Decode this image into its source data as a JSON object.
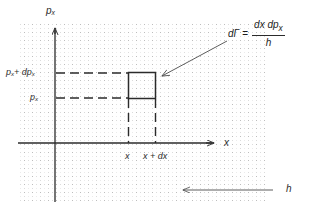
{
  "figure": {
    "type": "physics-diagram",
    "background": "#ffffff",
    "ink_color": "#2b2b2b",
    "grid_color": "#c9c9c9",
    "grid_spacing_px": 8,
    "plot_area": {
      "x": 18,
      "y": 22,
      "width": 248,
      "height": 180
    }
  },
  "axes": {
    "vertical": {
      "name": "momentum-axis",
      "label_main": "p",
      "label_sub": "x",
      "x_px": 55,
      "arrow": "up"
    },
    "horizontal": {
      "name": "position-axis",
      "label_main": "x",
      "label_sub": "",
      "y_px": 143,
      "arrow": "right"
    }
  },
  "tick_labels": {
    "y_upper": {
      "main": "p",
      "sub": "x",
      "suffix_main": " + dp",
      "suffix_sub": "x",
      "y_px": 73
    },
    "y_lower": {
      "main": "p",
      "sub": "x",
      "y_px": 98
    },
    "x_left": {
      "text": "x",
      "x_px": 128
    },
    "x_right": {
      "text": "x + dx",
      "x_px": 155
    }
  },
  "labels": {
    "y_upper_text": "p",
    "y_upper_sub": "x",
    "y_upper_plus": "+ dp",
    "y_upper_plus_sub": "x",
    "y_lower_text": "p",
    "y_lower_sub": "x",
    "x_tick_left": "x",
    "x_tick_right": "x + dx",
    "axis_x": "x",
    "axis_p": "p",
    "axis_p_sub": "x",
    "grid_label": "h"
  },
  "formula": {
    "name": "phase-space-element",
    "lhs_main": "d",
    "lhs_symbol": "Γ",
    "equals": "=",
    "numerator": "dx dp",
    "numerator_sub": "x",
    "denominator": "h"
  },
  "cell": {
    "name": "phase-space-cell",
    "left_px": 128,
    "right_px": 155,
    "top_px": 73,
    "bottom_px": 98,
    "stroke": "#2b2b2b",
    "fill": "none"
  },
  "annotations": [
    {
      "name": "formula-pointer",
      "kind": "arrow",
      "from": {
        "x": 228,
        "y": 40
      },
      "to": {
        "x": 159,
        "y": 77
      }
    },
    {
      "name": "grid-cell-pointer",
      "kind": "arrow",
      "from": {
        "x": 274,
        "y": 190
      },
      "to": {
        "x": 181,
        "y": 190
      },
      "label": "h"
    }
  ]
}
